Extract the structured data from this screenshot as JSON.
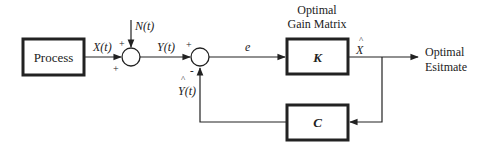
{
  "diagram": {
    "colors": {
      "stroke": "#222222",
      "background": "#ffffff"
    },
    "blocks": {
      "process": {
        "label": "Process"
      },
      "gain": {
        "label": "K",
        "title_line1": "Optimal",
        "title_line2": "Gain Matrix"
      },
      "observation": {
        "label": "C"
      }
    },
    "signals": {
      "process_output": "X(t)",
      "noise": "N(t)",
      "measurement": "Y(t)",
      "error": "e",
      "estimate": "X",
      "estimate_hat": "^",
      "predicted_measurement": "Y(t)",
      "predicted_hat": "^"
    },
    "summing_junctions": {
      "sum1": {
        "sign_top": "+",
        "sign_left": "+"
      },
      "sum2": {
        "sign_top": "+",
        "sign_bottom": "-"
      }
    },
    "output": {
      "line1": "Optimal",
      "line2": "Esitmate"
    }
  }
}
